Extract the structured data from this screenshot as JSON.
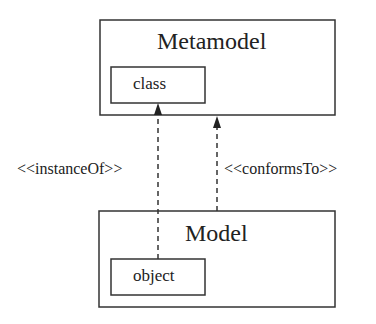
{
  "diagram": {
    "metamodel": {
      "title": "Metamodel",
      "inner": "class"
    },
    "model": {
      "title": "Model",
      "inner": "object"
    },
    "relations": [
      {
        "label": "<<instanceOf>>",
        "from": "object",
        "to": "class"
      },
      {
        "label": "<<conformsTo>>",
        "from": "Model",
        "to": "Metamodel"
      }
    ]
  }
}
